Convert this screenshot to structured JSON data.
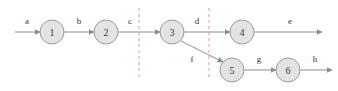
{
  "diagram": {
    "colors": {
      "node_fill": "#e3e3e3",
      "node_stroke": "#9a9a9a",
      "edge_stroke": "#8c8c8c",
      "cut_line": "#d49a9a",
      "label_text": "#333333",
      "background": "#ffffff"
    },
    "nodes": [
      {
        "id": "1",
        "label": "1",
        "cx": 52,
        "cy": 32,
        "r": 12
      },
      {
        "id": "2",
        "label": "2",
        "cx": 106,
        "cy": 32,
        "r": 12
      },
      {
        "id": "3",
        "label": "3",
        "cx": 172,
        "cy": 32,
        "r": 12
      },
      {
        "id": "4",
        "label": "4",
        "cx": 242,
        "cy": 32,
        "r": 12
      },
      {
        "id": "5",
        "label": "5",
        "cx": 232,
        "cy": 70,
        "r": 12
      },
      {
        "id": "6",
        "label": "6",
        "cx": 288,
        "cy": 70,
        "r": 12
      }
    ],
    "edges": [
      {
        "id": "a",
        "label": "a",
        "from": "start",
        "to": "1",
        "x1": 15,
        "y1": 32,
        "x2": 40,
        "y2": 32,
        "lx": 27,
        "ly": 24
      },
      {
        "id": "b",
        "label": "b",
        "from": "1",
        "to": "2",
        "x1": 64,
        "y1": 32,
        "x2": 94,
        "y2": 32,
        "lx": 79,
        "ly": 24
      },
      {
        "id": "c",
        "label": "c",
        "from": "2",
        "to": "3",
        "x1": 118,
        "y1": 32,
        "x2": 160,
        "y2": 32,
        "lx": 130,
        "ly": 24
      },
      {
        "id": "d",
        "label": "d",
        "from": "3",
        "to": "4",
        "x1": 184,
        "y1": 32,
        "x2": 230,
        "y2": 32,
        "lx": 197,
        "ly": 24
      },
      {
        "id": "e",
        "label": "e",
        "from": "4",
        "to": "end-top",
        "x1": 254,
        "y1": 32,
        "x2": 322,
        "y2": 32,
        "lx": 290,
        "ly": 24
      },
      {
        "id": "f",
        "label": "f",
        "from": "3",
        "to": "5",
        "x1": 181,
        "y1": 41,
        "x2": 223,
        "y2": 62,
        "lx": 192,
        "ly": 62
      },
      {
        "id": "g",
        "label": "g",
        "from": "5",
        "to": "6",
        "x1": 244,
        "y1": 70,
        "x2": 276,
        "y2": 70,
        "lx": 259,
        "ly": 62
      },
      {
        "id": "h",
        "label": "h",
        "from": "6",
        "to": "end-bottom",
        "x1": 300,
        "y1": 70,
        "x2": 332,
        "y2": 70,
        "lx": 315,
        "ly": 62
      }
    ],
    "cut_lines": [
      {
        "id": "cut-1",
        "x": 139,
        "y1": 8,
        "y2": 78
      },
      {
        "id": "cut-2",
        "x": 209,
        "y1": 8,
        "y2": 78
      }
    ]
  }
}
